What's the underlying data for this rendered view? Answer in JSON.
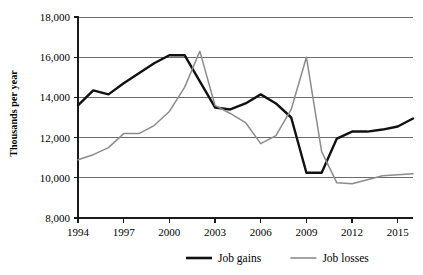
{
  "axis_title_y": "Thousands per year",
  "legend": [
    {
      "label": "Job gains",
      "color": "#111111"
    },
    {
      "label": "Job losses",
      "color": "#8c8c8c"
    }
  ],
  "y_tick_labels": [
    "18,000",
    "16,000",
    "14,000",
    "12,000",
    "10,000",
    "8,000"
  ],
  "x_tick_labels": [
    "1994",
    "1997",
    "2000",
    "2003",
    "2006",
    "2009",
    "2012",
    "2015"
  ],
  "chart_data": {
    "type": "line",
    "title": "",
    "subtitle": "",
    "xlabel": "",
    "ylabel": "Thousands per year",
    "xlim": [
      1994,
      2016
    ],
    "ylim": [
      8000,
      18000
    ],
    "ytick_values": [
      18000,
      16000,
      14000,
      12000,
      10000,
      8000
    ],
    "xtick_values": [
      1994,
      1997,
      2000,
      2003,
      2006,
      2009,
      2012,
      2015
    ],
    "grid": "horizontal",
    "legend_position": "bottom",
    "x": [
      1994,
      1995,
      1996,
      1997,
      1998,
      1999,
      2000,
      2001,
      2002,
      2003,
      2004,
      2005,
      2006,
      2007,
      2008,
      2009,
      2010,
      2011,
      2012,
      2013,
      2014,
      2015,
      2016
    ],
    "series": [
      {
        "name": "Job gains",
        "color": "#111111",
        "values": [
          13600,
          14350,
          14150,
          14700,
          15200,
          15700,
          16100,
          16100,
          14800,
          13500,
          13400,
          13700,
          14150,
          13700,
          13000,
          10250,
          10250,
          11950,
          12300,
          12300,
          12400,
          12550,
          12950
        ]
      },
      {
        "name": "Job losses",
        "color": "#8c8c8c",
        "values": [
          10900,
          11150,
          11500,
          12200,
          12200,
          12600,
          13300,
          14500,
          16300,
          13600,
          13200,
          12750,
          11700,
          12100,
          13400,
          16000,
          11300,
          9750,
          9700,
          9900,
          10100,
          10150,
          10200
        ]
      }
    ]
  },
  "plot_geometry": {
    "left": 78,
    "right": 413,
    "top": 17,
    "bottom": 218
  }
}
